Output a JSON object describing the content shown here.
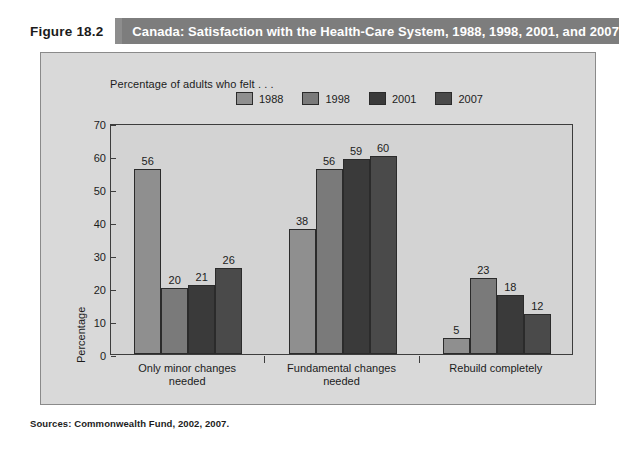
{
  "figure": {
    "number_label": "Figure 18.2",
    "title": "Canada: Satisfaction with the Health-Care System, 1988, 1998, 2001, and 2007",
    "caption_note": "Percentage of adults who felt . . .",
    "sources": "Sources: Commonwealth Fund, 2002, 2007."
  },
  "colors": {
    "title_bar_bg": "#7d7d7d",
    "title_bar_text": "#ffffff",
    "panel_bg": "#d9d9d9",
    "plot_bg": "#d3d3d3",
    "axis": "#3d3d3d",
    "series_1988": "#8f8f8f",
    "series_1998": "#7a7a7a",
    "series_2001": "#3a3a3a",
    "series_2007": "#4a4a4a"
  },
  "chart_data": {
    "type": "bar",
    "title": "Canada: Satisfaction with the Health-Care System, 1988, 1998, 2001, and 2007",
    "subtitle": "Percentage of adults who felt . . .",
    "xlabel": "",
    "ylabel": "Percentage",
    "ylim": [
      0,
      70
    ],
    "yticks": [
      0,
      10,
      20,
      30,
      40,
      50,
      60,
      70
    ],
    "grid": false,
    "legend_position": "top",
    "categories": [
      "Only minor changes needed",
      "Fundamental changes needed",
      "Rebuild completely"
    ],
    "category_lines": [
      [
        "Only minor changes",
        "needed"
      ],
      [
        "Fundamental changes",
        "needed"
      ],
      [
        "Rebuild completely",
        ""
      ]
    ],
    "series": [
      {
        "name": "1988",
        "color": "#8f8f8f",
        "values": [
          56,
          38,
          5
        ]
      },
      {
        "name": "1998",
        "color": "#7a7a7a",
        "values": [
          20,
          56,
          23
        ]
      },
      {
        "name": "2001",
        "color": "#3a3a3a",
        "values": [
          21,
          59,
          18
        ]
      },
      {
        "name": "2007",
        "color": "#4a4a4a",
        "values": [
          26,
          60,
          12
        ]
      }
    ],
    "source": "Sources: Commonwealth Fund, 2002, 2007."
  }
}
